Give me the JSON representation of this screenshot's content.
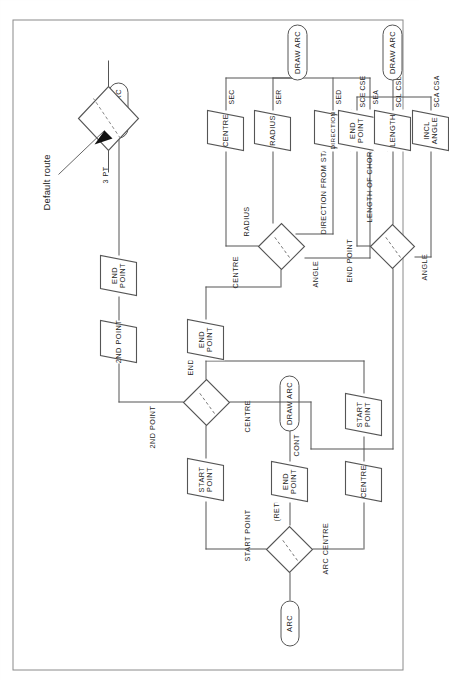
{
  "figure": {
    "legend": {
      "label": "Default route",
      "marker": "dashed-line-through-decision-diamond"
    },
    "caption": "",
    "colors": {
      "line": "#555555",
      "text": "#1c1c1c",
      "frame": "#8a8a8a",
      "background": "#ffffff"
    }
  },
  "nodes": {
    "start_terminal": {
      "label": "ARC",
      "shape": "terminator"
    },
    "decision_1": {
      "shape": "decision",
      "branches": [
        "START POINT",
        "(RETURN)",
        "ARC CENTRE"
      ]
    },
    "decision_2": {
      "shape": "decision",
      "branches": [
        "2ND POINT",
        "END",
        "CENTRE"
      ]
    },
    "decision_3": {
      "shape": "decision",
      "branches": [
        "CENTRE",
        "RADIUS",
        "DIRECTION FROM START",
        "ANGLE"
      ]
    },
    "decision_4": {
      "shape": "decision",
      "branches": [
        "END POINT",
        "LENGTH OF CHORD",
        "ANGLE"
      ]
    },
    "io_end_point_return": {
      "label": "END POINT",
      "shape": "parallelogram"
    },
    "io_centre_1": {
      "label": "CENTRE",
      "shape": "parallelogram"
    },
    "io_start_point_1": {
      "label": "START POINT",
      "shape": "parallelogram"
    },
    "io_start_point_2": {
      "label": "START POINT",
      "shape": "parallelogram"
    },
    "io_2nd_point": {
      "label": "2ND POINT",
      "shape": "parallelogram"
    },
    "io_end_point_3pt": {
      "label": "END POINT",
      "shape": "parallelogram"
    },
    "io_end_point_centre": {
      "label": "END POINT",
      "shape": "parallelogram"
    },
    "io_centre_2": {
      "label": "CENTRE",
      "shape": "parallelogram"
    },
    "io_radius": {
      "label": "RADIUS",
      "shape": "parallelogram"
    },
    "io_direction": {
      "label": "DIRECTION",
      "shape": "parallelogram"
    },
    "io_incl_angle_1": {
      "label": "INCL ANGLE",
      "shape": "parallelogram"
    },
    "io_end_point_chord": {
      "label": "END POINT",
      "shape": "parallelogram"
    },
    "io_length": {
      "label": "LENGTH",
      "shape": "parallelogram"
    },
    "io_incl_angle_2": {
      "label": "INCL ANGLE",
      "shape": "parallelogram"
    },
    "end_terminal_1": {
      "label": "DRAW ARC",
      "shape": "terminator"
    },
    "end_terminal_2": {
      "label": "DRAW ARC",
      "shape": "terminator"
    },
    "end_terminal_3": {
      "label": "DRAW ARC",
      "shape": "terminator"
    },
    "end_terminal_4": {
      "label": "DRAW ARC",
      "shape": "terminator"
    }
  },
  "edge_labels": {
    "start_point": "START POINT",
    "return": "(RETURN)",
    "arc_centre": "ARC CENTRE",
    "cont": "CONT",
    "second_point": "2ND POINT",
    "end": "END",
    "centre": "CENTRE",
    "three_pt": "3 PT",
    "centre_2": "CENTRE",
    "radius": "RADIUS",
    "direction_from_start": "DIRECTION FROM START",
    "angle": "ANGLE",
    "end_point": "END POINT",
    "length_of_chord": "LENGTH OF CHORD",
    "angle_2": "ANGLE"
  },
  "option_codes": {
    "sec": "SEC",
    "ser": "SER",
    "sed": "SED",
    "sea": "SEA",
    "sce": "SCE",
    "cse": "CSE",
    "scl": "SCL",
    "csl": "CSL",
    "sca": "SCA",
    "csa": "CSA"
  }
}
